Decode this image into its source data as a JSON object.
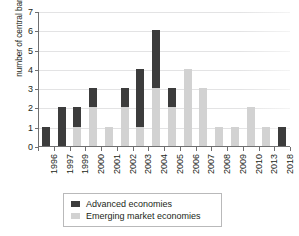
{
  "chart_data": {
    "type": "bar",
    "title": "",
    "subtitle": "",
    "xlabel": "",
    "ylabel": "number of central banks",
    "ylim": [
      0,
      7
    ],
    "ytick_labels": [
      "0",
      "1",
      "2",
      "3",
      "4",
      "5",
      "6",
      "7"
    ],
    "ytick_values": [
      0,
      1,
      2,
      3,
      4,
      5,
      6,
      7
    ],
    "grid": true,
    "stacked": true,
    "legend_position": "bottom",
    "categories": [
      "1996",
      "1997",
      "1999",
      "2000",
      "2001",
      "2002",
      "2003",
      "2004",
      "2005",
      "2006",
      "2007",
      "2008",
      "2009",
      "2010",
      "2013",
      "2018"
    ],
    "series": [
      {
        "name": "Emerging market economies",
        "color": "#d2d2d2",
        "values": [
          0,
          0,
          1,
          2,
          1,
          2,
          1,
          3,
          2,
          4,
          3,
          1,
          1,
          2,
          1,
          0
        ]
      },
      {
        "name": "Advanced economies",
        "color": "#3c3c3c",
        "values": [
          1,
          2,
          1,
          1,
          0,
          1,
          3,
          3,
          1,
          0,
          0,
          0,
          0,
          0,
          0,
          1
        ]
      }
    ],
    "totals": [
      1,
      2,
      2,
      3,
      1,
      3,
      4,
      6,
      3,
      4,
      3,
      1,
      1,
      2,
      1,
      1
    ]
  },
  "legend": {
    "items": [
      {
        "label": "Advanced economies",
        "color": "#3c3c3c"
      },
      {
        "label": "Emerging market economies",
        "color": "#d2d2d2"
      }
    ]
  }
}
